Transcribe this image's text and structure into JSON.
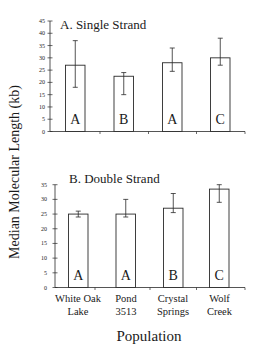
{
  "figure": {
    "ylabel": "Median Molecular Length (kb)",
    "xlabel": "Population",
    "categories": [
      [
        "White Oak",
        "Lake"
      ],
      [
        "Pond",
        "3513"
      ],
      [
        "Crystal",
        "Springs"
      ],
      [
        "Wolf",
        "Creek"
      ]
    ]
  },
  "chart_data": [
    {
      "type": "bar",
      "title": "A. Single Strand",
      "xlabel": "Population",
      "ylabel": "Median Molecular Length (kb)",
      "categories": [
        "White Oak Lake",
        "Pond 3513",
        "Crystal Springs",
        "Wolf Creek"
      ],
      "values": [
        27,
        22.5,
        28,
        30
      ],
      "error_low": [
        18,
        15,
        24.5,
        27
      ],
      "error_high": [
        37,
        24,
        34,
        38
      ],
      "group_letters": [
        "A",
        "B",
        "A",
        "C"
      ],
      "ylim": [
        0,
        45
      ],
      "yticks": [
        0,
        5,
        10,
        15,
        20,
        25,
        30,
        35,
        40,
        45
      ],
      "grid": false,
      "legend": null
    },
    {
      "type": "bar",
      "title": "B. Double Strand",
      "xlabel": "Population",
      "ylabel": "Median Molecular Length (kb)",
      "categories": [
        "White Oak Lake",
        "Pond 3513",
        "Crystal Springs",
        "Wolf Creek"
      ],
      "values": [
        25,
        25,
        27,
        33.5
      ],
      "error_low": [
        24,
        24,
        25.5,
        29
      ],
      "error_high": [
        26,
        30,
        32,
        35
      ],
      "group_letters": [
        "A",
        "A",
        "B",
        "C"
      ],
      "ylim": [
        0,
        35
      ],
      "yticks": [
        0,
        5,
        10,
        15,
        20,
        25,
        30,
        35
      ],
      "grid": false,
      "legend": null
    }
  ],
  "colors": {
    "bar_fill": "#ffffff",
    "stroke": "#2a2a2a",
    "text": "#1a1a1a"
  }
}
